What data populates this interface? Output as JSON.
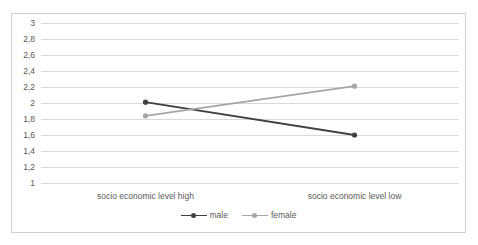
{
  "chart_data": {
    "type": "line",
    "title": "",
    "xlabel": "",
    "ylabel": "",
    "categories": [
      "socio economic level high",
      "socio economic level low"
    ],
    "series": [
      {
        "name": "male",
        "values": [
          2.01,
          1.6
        ],
        "color": "#404040"
      },
      {
        "name": "female",
        "values": [
          1.84,
          2.21
        ],
        "color": "#a6a6a6"
      }
    ],
    "ylim": [
      1,
      3
    ],
    "ytick_step": 0.2,
    "ytick_labels": [
      "3",
      "2,8",
      "2,6",
      "2,4",
      "2,2",
      "2",
      "1,8",
      "1,6",
      "1,4",
      "1,2",
      "1"
    ],
    "ytick_values": [
      3,
      2.8,
      2.6,
      2.4,
      2.2,
      2,
      1.8,
      1.6,
      1.4,
      1.2,
      1
    ],
    "grid": true,
    "legend_position": "bottom",
    "decimal_separator": ","
  },
  "legend": {
    "entries": [
      {
        "label": "male"
      },
      {
        "label": "female"
      }
    ]
  },
  "colors": {
    "male": "#404040",
    "female": "#a6a6a6",
    "gridline": "#d9d9d9",
    "border": "#d0d0d0",
    "text": "#595959"
  }
}
